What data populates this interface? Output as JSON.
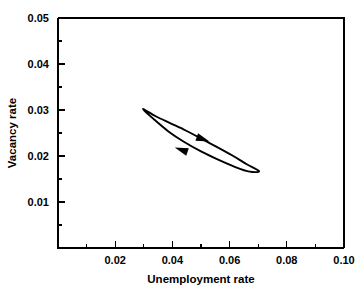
{
  "chart_data": {
    "type": "line",
    "title": "",
    "xlabel": "Unemployment rate",
    "ylabel": "Vacancy rate",
    "xlim": [
      0.0,
      0.1
    ],
    "ylim": [
      0.0,
      0.05
    ],
    "xticks": [
      0.02,
      0.04,
      0.06,
      0.08,
      0.1
    ],
    "xticklabels": [
      "0.02",
      "0.04",
      "0.06",
      "0.08",
      "0.10"
    ],
    "xminorticks": [
      0.01,
      0.03,
      0.05,
      0.07,
      0.09
    ],
    "yticks": [
      0.01,
      0.02,
      0.03,
      0.04,
      0.05
    ],
    "yticklabels": [
      "0.01",
      "0.02",
      "0.03",
      "0.04",
      "0.05"
    ],
    "yminorticks": [
      0.005,
      0.015,
      0.025,
      0.035,
      0.045
    ],
    "grid": false,
    "legend": null,
    "series": [
      {
        "name": "Beveridge curve loop",
        "closed": true,
        "direction": "clockwise",
        "points": [
          [
            0.0297,
            0.0302
          ],
          [
            0.034,
            0.0287
          ],
          [
            0.039,
            0.0272
          ],
          [
            0.0445,
            0.0256
          ],
          [
            0.05,
            0.0238
          ],
          [
            0.0555,
            0.022
          ],
          [
            0.061,
            0.0201
          ],
          [
            0.066,
            0.0182
          ],
          [
            0.0703,
            0.0167
          ],
          [
            0.067,
            0.0166
          ],
          [
            0.062,
            0.0176
          ],
          [
            0.056,
            0.0192
          ],
          [
            0.05,
            0.021
          ],
          [
            0.044,
            0.0231
          ],
          [
            0.0385,
            0.0254
          ],
          [
            0.0335,
            0.028
          ],
          [
            0.0297,
            0.0302
          ]
        ]
      }
    ],
    "annotations": [
      {
        "name": "upper-branch-arrow",
        "x": 0.05,
        "y": 0.0238,
        "direction": "right-down"
      },
      {
        "name": "lower-branch-arrow",
        "x": 0.0438,
        "y": 0.0212,
        "direction": "left-up"
      }
    ]
  }
}
